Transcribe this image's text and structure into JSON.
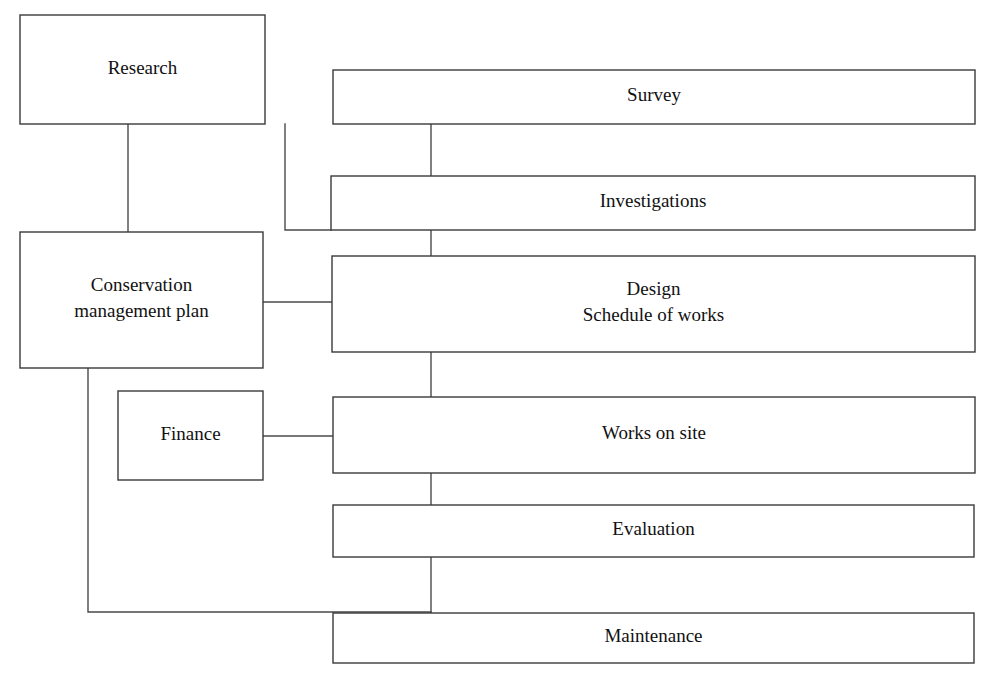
{
  "diagram": {
    "type": "flowchart",
    "background_color": "#ffffff",
    "line_color": "#4a4a4a",
    "text_color": "#111111",
    "nodes": [
      {
        "id": "research",
        "label": "Research",
        "lines": [
          "Research"
        ],
        "x": 20,
        "y": 15,
        "width": 245,
        "height": 109
      },
      {
        "id": "survey",
        "label": "Survey",
        "lines": [
          "Survey"
        ],
        "x": 333,
        "y": 70,
        "width": 642,
        "height": 54
      },
      {
        "id": "investigations",
        "label": "Investigations",
        "lines": [
          "Investigations"
        ],
        "x": 331,
        "y": 176,
        "width": 644,
        "height": 54
      },
      {
        "id": "conservation-management-plan",
        "label": "Conservation management plan",
        "lines": [
          "Conservation",
          "management plan"
        ],
        "x": 20,
        "y": 232,
        "width": 243,
        "height": 136
      },
      {
        "id": "design-schedule-of-works",
        "label": "Design / Schedule of works",
        "lines": [
          "Design",
          "Schedule of works"
        ],
        "x": 332,
        "y": 256,
        "width": 643,
        "height": 96
      },
      {
        "id": "finance",
        "label": "Finance",
        "lines": [
          "Finance"
        ],
        "x": 118,
        "y": 391,
        "width": 145,
        "height": 89
      },
      {
        "id": "works-on-site",
        "label": "Works on site",
        "lines": [
          "Works on site"
        ],
        "x": 333,
        "y": 397,
        "width": 642,
        "height": 76
      },
      {
        "id": "evaluation",
        "label": "Evaluation",
        "lines": [
          "Evaluation"
        ],
        "x": 333,
        "y": 505,
        "width": 641,
        "height": 52
      },
      {
        "id": "maintenance",
        "label": "Maintenance",
        "lines": [
          "Maintenance"
        ],
        "x": 333,
        "y": 613,
        "width": 641,
        "height": 50
      }
    ],
    "connectors": [
      {
        "id": "research-to-conservation",
        "from": "research",
        "to": "conservation-management-plan",
        "path": "M 128 124 L 128 232"
      },
      {
        "id": "research-to-investigations",
        "from": "research",
        "to": "investigations",
        "path": "M 285 124 L 285 230 L 331 230"
      },
      {
        "id": "survey-spine",
        "from": "survey",
        "to": "maintenance",
        "path": "M 431 124 L 431 613"
      },
      {
        "id": "conservation-to-design",
        "from": "conservation-management-plan",
        "to": "design-schedule-of-works",
        "path": "M 263 302 L 332 302"
      },
      {
        "id": "finance-to-works-on-site",
        "from": "finance",
        "to": "works-on-site",
        "path": "M 263 436 L 333 436"
      },
      {
        "id": "conservation-to-maintenance",
        "from": "conservation-management-plan",
        "to": "maintenance",
        "path": "M 88 368 L 88 612 L 431 612"
      }
    ]
  }
}
